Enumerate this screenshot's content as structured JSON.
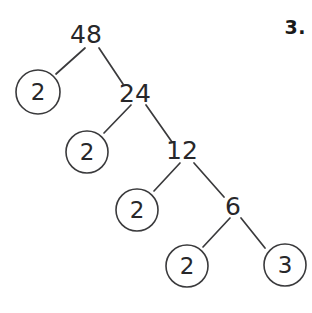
{
  "worksheet": {
    "problem_number": "3.",
    "background_color": "#ffffff",
    "ink_color": "#3a3a3c",
    "text_color": "#27272a"
  },
  "chart_data": {
    "type": "diagram",
    "diagram_kind": "factor-tree",
    "title": "",
    "root_value": 48,
    "factorization": "48 = 2 x 2 x 2 x 2 x 3",
    "nodes": [
      {
        "id": "n48",
        "label": "48",
        "value": 48,
        "circled": false,
        "x": 86,
        "y": 35,
        "r": 0
      },
      {
        "id": "n2a",
        "label": "2",
        "value": 2,
        "circled": true,
        "x": 38,
        "y": 92,
        "r": 22
      },
      {
        "id": "n24",
        "label": "24",
        "value": 24,
        "circled": false,
        "x": 135,
        "y": 94,
        "r": 0
      },
      {
        "id": "n2b",
        "label": "2",
        "value": 2,
        "circled": true,
        "x": 87,
        "y": 152,
        "r": 21
      },
      {
        "id": "n12",
        "label": "12",
        "value": 12,
        "circled": false,
        "x": 182,
        "y": 151,
        "r": 0
      },
      {
        "id": "n2c",
        "label": "2",
        "value": 2,
        "circled": true,
        "x": 137,
        "y": 210,
        "r": 21
      },
      {
        "id": "n6",
        "label": "6",
        "value": 6,
        "circled": false,
        "x": 233,
        "y": 207,
        "r": 0
      },
      {
        "id": "n2d",
        "label": "2",
        "value": 2,
        "circled": true,
        "x": 187,
        "y": 266,
        "r": 21
      },
      {
        "id": "n3",
        "label": "3",
        "value": 3,
        "circled": true,
        "x": 285,
        "y": 265,
        "r": 21
      }
    ],
    "edges": [
      {
        "from": "n48",
        "to": "n2a",
        "x1": 85,
        "y1": 48,
        "x2": 56,
        "y2": 74
      },
      {
        "from": "n48",
        "to": "n24",
        "x1": 99,
        "y1": 48,
        "x2": 123,
        "y2": 84
      },
      {
        "from": "n24",
        "to": "n2b",
        "x1": 131,
        "y1": 105,
        "x2": 104,
        "y2": 133
      },
      {
        "from": "n24",
        "to": "n12",
        "x1": 146,
        "y1": 105,
        "x2": 172,
        "y2": 142
      },
      {
        "from": "n12",
        "to": "n2c",
        "x1": 180,
        "y1": 163,
        "x2": 154,
        "y2": 191
      },
      {
        "from": "n12",
        "to": "n6",
        "x1": 194,
        "y1": 163,
        "x2": 224,
        "y2": 197
      },
      {
        "from": "n6",
        "to": "n2d",
        "x1": 230,
        "y1": 218,
        "x2": 203,
        "y2": 247
      },
      {
        "from": "n6",
        "to": "n3",
        "x1": 241,
        "y1": 218,
        "x2": 265,
        "y2": 248
      }
    ]
  }
}
